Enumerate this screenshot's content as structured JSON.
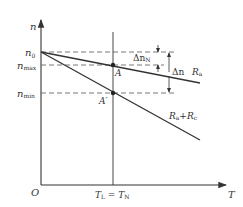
{
  "diagram": {
    "axes": {
      "y_label": "n",
      "x_label": "T",
      "origin_label": "O"
    },
    "y_ticks": {
      "n0": {
        "main": "n",
        "sub": "0"
      },
      "nmax": {
        "main": "n",
        "sub": "max"
      },
      "nmin": {
        "main": "n",
        "sub": "min"
      }
    },
    "x_ticks": {
      "load": {
        "main": "T",
        "sub": "L",
        "eq": " = ",
        "main2": "T",
        "sub2": "N"
      }
    },
    "points": {
      "A": "A",
      "A_prime": "A′"
    },
    "annotations": {
      "delta_nN": {
        "main": "Δn",
        "sub": "N"
      },
      "delta_n": {
        "main": "Δn"
      }
    },
    "curves": [
      {
        "name": "Ra",
        "main": "R",
        "sub": "a"
      },
      {
        "name": "Ra+Rc",
        "main": "R",
        "sub": "a",
        "plus": "+R",
        "sub2": "c"
      }
    ],
    "colors": {
      "line": "#333333",
      "dashed": "#555555"
    }
  }
}
